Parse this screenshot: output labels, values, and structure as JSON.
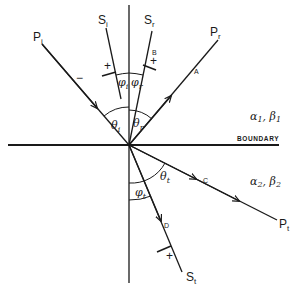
{
  "diagram": {
    "boundary_label": "BOUNDARY",
    "medium_1": {
      "label": "α₁, β₁",
      "alpha": "α",
      "alpha_sub": "1",
      "beta": "β",
      "beta_sub": "1"
    },
    "medium_2": {
      "label": "α₂, β₂",
      "alpha": "α",
      "alpha_sub": "2",
      "beta": "β",
      "beta_sub": "2"
    },
    "rays": {
      "incident_p": {
        "name": "P",
        "sub": "i",
        "amp_label": "",
        "polarity": "−"
      },
      "incident_s": {
        "name": "S",
        "sub": "i",
        "polarity": "+"
      },
      "reflected_s": {
        "name": "S",
        "sub": "r",
        "amp_label": "B",
        "polarity": "+"
      },
      "reflected_p": {
        "name": "P",
        "sub": "r",
        "amp_label": "A"
      },
      "transmitted_p": {
        "name": "P",
        "sub": "t",
        "amp_label": "C"
      },
      "transmitted_s": {
        "name": "S",
        "sub": "t",
        "amp_label": "D",
        "polarity": "+"
      }
    },
    "angles": {
      "theta_i": {
        "sym": "θ",
        "sub": "i"
      },
      "theta_r": {
        "sym": "θ",
        "sub": "r"
      },
      "phi_i": {
        "sym": "φ",
        "sub": "i"
      },
      "phi_r": {
        "sym": "φ",
        "sub": "r"
      },
      "theta_t": {
        "sym": "θ",
        "sub": "t"
      },
      "phi_t": {
        "sym": "φ",
        "sub": "t"
      }
    }
  }
}
